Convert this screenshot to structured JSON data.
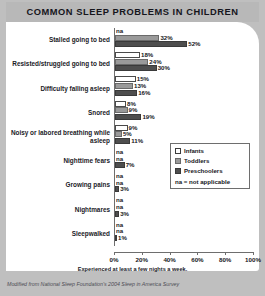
{
  "title": "COMMON SLEEP PROBLEMS IN CHILDREN",
  "footnote": "Experienced at least a few nights a week.",
  "credit": "Modified from National Sleep Foundation's 2004 Sleep in America Survey",
  "legend": {
    "items": [
      {
        "label": "Infants",
        "color": "#ffffff"
      },
      {
        "label": "Toddlers",
        "color": "#9a9a9a"
      },
      {
        "label": "Preschoolers",
        "color": "#4e4e4e"
      }
    ],
    "note": "na = not applicable"
  },
  "chart_data": {
    "type": "bar",
    "orientation": "horizontal",
    "title": "COMMON SLEEP PROBLEMS IN CHILDREN",
    "xlabel": "Experienced at least a few nights a week.",
    "ylabel": "",
    "xlim": [
      0,
      100
    ],
    "xticks": [
      "0%",
      "20%",
      "40%",
      "60%",
      "80%",
      "100%"
    ],
    "xtickvalues": [
      0,
      20,
      40,
      60,
      80,
      100
    ],
    "grid": false,
    "legend_position": "center-right",
    "categories": [
      "Stalled going to bed",
      "Resisted/struggled going to bed",
      "Difficulty falling asleep",
      "Snored",
      "Noisy or labored breathing while asleep",
      "Nighttime fears",
      "Growing pains",
      "Nightmares",
      "Sleepwalked"
    ],
    "series": [
      {
        "name": "Infants",
        "color": "#ffffff",
        "values": [
          null,
          18,
          15,
          8,
          9,
          null,
          null,
          null,
          null
        ],
        "labels": [
          "na",
          "18%",
          "15%",
          "8%",
          "9%",
          "na",
          "na",
          "na",
          "na"
        ]
      },
      {
        "name": "Toddlers",
        "color": "#9a9a9a",
        "values": [
          32,
          24,
          13,
          9,
          5,
          null,
          null,
          null,
          null
        ],
        "labels": [
          "32%",
          "24%",
          "13%",
          "9%",
          "5%",
          "na",
          "na",
          "na",
          "na"
        ]
      },
      {
        "name": "Preschoolers",
        "color": "#4e4e4e",
        "values": [
          52,
          30,
          16,
          19,
          11,
          7,
          3,
          3,
          1
        ],
        "labels": [
          "52%",
          "30%",
          "16%",
          "19%",
          "11%",
          "7%",
          "3%",
          "3%",
          "1%"
        ]
      }
    ]
  }
}
